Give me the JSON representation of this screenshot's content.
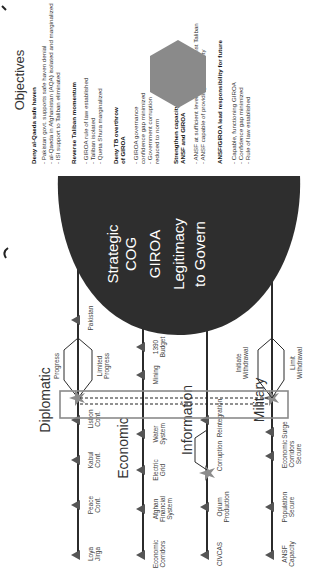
{
  "diagram": {
    "lines_of_effort": [
      {
        "name": "Diplomatic",
        "markers": [
          {
            "label": [
              "Loya",
              "Jirga"
            ],
            "type": "triangle"
          },
          {
            "label": [
              "Peace",
              "Conf."
            ],
            "type": "triangle"
          },
          {
            "label": [
              "Kabul",
              "Conf."
            ],
            "type": "triangle"
          },
          {
            "label": [
              "Lisbon",
              "Conf."
            ],
            "type": "triangle"
          },
          {
            "label": [
              "Pakistan"
            ],
            "type": "triangle"
          }
        ],
        "branch": {
          "upper": "Progress",
          "lower": [
            "Limited",
            "Progress"
          ]
        }
      },
      {
        "name": "Economic",
        "markers": [
          {
            "label": [
              "Economic",
              "Corridors"
            ],
            "type": "triangle"
          },
          {
            "label": [
              "Afghan",
              "Financial",
              "System"
            ],
            "type": "triangle"
          },
          {
            "label": [
              "Electric",
              "Grid"
            ],
            "type": "triangle"
          },
          {
            "label": [
              "Water",
              "System"
            ],
            "type": "triangle"
          },
          {
            "label": [
              "Mining"
            ],
            "type": "triangle"
          },
          {
            "label": [
              "1390",
              "Budget"
            ],
            "type": "triangle"
          }
        ]
      },
      {
        "name": "Information",
        "markers": [
          {
            "label": [
              "CIVCAS"
            ],
            "type": "triangle"
          },
          {
            "label": [
              "Opium",
              "Production"
            ],
            "type": "triangle"
          },
          {
            "label": [
              "Corruption"
            ],
            "type": "star"
          },
          {
            "label": [
              "Reintegration"
            ],
            "type": "triangle"
          },
          {
            "label": [
              "Afghan",
              "Governance"
            ],
            "type": "triangle"
          },
          {
            "label": [
              "ANSF",
              "Capacity"
            ],
            "type": "triangle"
          }
        ]
      },
      {
        "name": "Military",
        "markers": [
          {
            "label": [
              "ANSF",
              "Capacity"
            ],
            "type": "triangle"
          },
          {
            "label": [
              "Population",
              "Secure"
            ],
            "type": "triangle"
          },
          {
            "label": [
              "Economic",
              "Corridors",
              "Secure"
            ],
            "type": "triangle"
          },
          {
            "label": [
              "Surge"
            ],
            "type": "triangle"
          }
        ],
        "branch": {
          "upper": [
            "Initiate",
            "Withdrawal"
          ],
          "lower": [
            "Limit",
            "Withdrawal"
          ]
        }
      }
    ],
    "center_of_gravity": {
      "lines": [
        "Strategic",
        "COG",
        "GIROA",
        "Legitimacy",
        "to Govern"
      ]
    },
    "objectives": {
      "title": "Objectives",
      "groups": [
        {
          "heading": [
            "Deny al-Qaeda safe haven"
          ],
          "items": [
            "- Pakistan govt. supports safe haven denial",
            "- al-Qaeda in Afghanistan (AQA) isolated and marginalized",
            "- ISI support to Taliban eliminated"
          ]
        },
        {
          "heading": [
            "Reverse Taliban momentum"
          ],
          "items": [
            "- GIROA rule of law established",
            "- Taliban isolated",
            "- Queta Shura marginalized"
          ]
        },
        {
          "heading": [
            "Deny TB overthrow",
            "of GIROA"
          ],
          "items": [
            "- GIROA governance",
            "confidence gap minimized",
            "- Government corruption",
            "reduced to norm"
          ]
        },
        {
          "heading": [
            "Strengthen capacity of",
            "ANSF and GIROA"
          ],
          "items": [
            "- ANSF at sufficient levels to defend against Taliban",
            "- ANSF capable of providing local security"
          ]
        },
        {
          "heading": [
            "ANSF/GIROA lead responsibility for future"
          ],
          "items": [
            "- Capable, functioning GIROA",
            "- Confidence gap minimized",
            "- Rule of law established"
          ]
        }
      ]
    },
    "end_state": {
      "title": "End State",
      "subtitle": [
        "Disrupt, Dismantle,",
        "Defeat AQA"
      ]
    },
    "colors": {
      "line": "#2b2b2b",
      "marker": "#555555",
      "cog_fill": "#2e2e2e",
      "end_state_fill": "#8a8a8a",
      "highlight_box": "#8a8a8a",
      "star": "#8c8c8c"
    }
  }
}
